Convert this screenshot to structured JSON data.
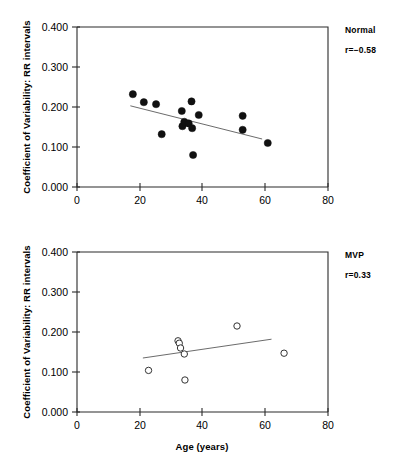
{
  "figure": {
    "background_color": "#ffffff",
    "axis_color": "#2b2b2b",
    "fit_line_color": "#5a5a5a",
    "marker_fill_normal": "#111111",
    "marker_edge_mvp": "#333333"
  },
  "axes": {
    "x_label": "Age (years)",
    "y_label": "Coefficient of Variability: RR intervals",
    "x_ticks": [
      "0",
      "20",
      "40",
      "60",
      "80"
    ],
    "x_tick_values": [
      0,
      20,
      40,
      60,
      80
    ],
    "y_ticks": [
      "0.000",
      "0.100",
      "0.200",
      "0.300",
      "0.400"
    ],
    "y_tick_values": [
      0.0,
      0.1,
      0.2,
      0.3,
      0.4
    ],
    "xlim": [
      0,
      80
    ],
    "ylim": [
      0.0,
      0.4
    ]
  },
  "chart_data": [
    {
      "type": "scatter",
      "panel_id": "normal",
      "title": "Normal",
      "annotation_group": "Normal",
      "annotation_r": "r=−0.58",
      "correlation": -0.58,
      "xlabel": "",
      "ylabel": "Coefficient of Variability: RR intervals",
      "xlim": [
        0,
        80
      ],
      "ylim": [
        0.0,
        0.4
      ],
      "grid": false,
      "legend": "none",
      "marker_style": "filled-circle",
      "x": [
        17.8,
        21.3,
        25.2,
        27.0,
        33.4,
        33.6,
        34.2,
        35.6,
        36.5,
        36.7,
        37.0,
        38.8,
        52.8,
        52.8,
        60.8
      ],
      "y": [
        0.232,
        0.212,
        0.207,
        0.132,
        0.19,
        0.152,
        0.163,
        0.159,
        0.214,
        0.147,
        0.08,
        0.18,
        0.178,
        0.143,
        0.11
      ],
      "fit_line": {
        "x": [
          17.0,
          59.0
        ],
        "y": [
          0.203,
          0.12
        ]
      }
    },
    {
      "type": "scatter",
      "panel_id": "mvp",
      "title": "MVP",
      "annotation_group": "MVP",
      "annotation_r": "r=0.33",
      "correlation": 0.33,
      "xlabel": "Age (years)",
      "ylabel": "Coefficient of Variability: RR intervals",
      "xlim": [
        0,
        80
      ],
      "ylim": [
        0.0,
        0.4
      ],
      "grid": false,
      "legend": "none",
      "marker_style": "open-circle",
      "x": [
        22.8,
        32.2,
        32.6,
        33.0,
        34.2,
        34.4,
        51.0,
        66.0
      ],
      "y": [
        0.104,
        0.178,
        0.172,
        0.16,
        0.145,
        0.08,
        0.215,
        0.147
      ],
      "fit_line": {
        "x": [
          21.0,
          62.0
        ],
        "y": [
          0.135,
          0.182
        ]
      }
    }
  ]
}
